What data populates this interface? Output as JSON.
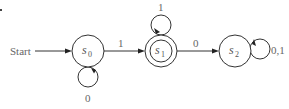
{
  "diagram": {
    "type": "finite-state-automaton",
    "start_label": "Start",
    "states": [
      {
        "id": "s0",
        "name": "s",
        "sub": "0",
        "accepting": false,
        "start": true
      },
      {
        "id": "s1",
        "name": "s",
        "sub": "1",
        "accepting": true,
        "start": false
      },
      {
        "id": "s2",
        "name": "s",
        "sub": "2",
        "accepting": false,
        "start": false
      }
    ],
    "transitions": [
      {
        "from": "s0",
        "to": "s0",
        "label": "0"
      },
      {
        "from": "s0",
        "to": "s1",
        "label": "1"
      },
      {
        "from": "s1",
        "to": "s1",
        "label": "1"
      },
      {
        "from": "s1",
        "to": "s2",
        "label": "0"
      },
      {
        "from": "s2",
        "to": "s2",
        "label": "0,1"
      }
    ],
    "colors": {
      "stroke": "#333333",
      "label": "#666666",
      "background": "#ffffff"
    }
  }
}
